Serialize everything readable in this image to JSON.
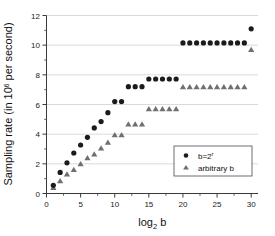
{
  "chart_data": {
    "type": "scatter",
    "title": "",
    "xlabel": "log2 b",
    "xlabel_base": "log",
    "xlabel_subscript": "2",
    "xlabel_arg": "b",
    "ylabel": "Sampling rate (in 10^6 per second)",
    "ylabel_prefix": "Sampling rate (in 10",
    "ylabel_exponent": "6",
    "ylabel_suffix": " per second)",
    "xlim": [
      0,
      31
    ],
    "ylim": [
      0,
      12
    ],
    "xticks": [
      0,
      5,
      10,
      15,
      20,
      25,
      30
    ],
    "xticklabels": [
      "0",
      "5",
      "10",
      "15",
      "20",
      "25",
      "30"
    ],
    "yticks": [
      0,
      2,
      4,
      6,
      8,
      10,
      12
    ],
    "yticklabels": [
      "0",
      "2",
      "4",
      "6",
      "8",
      "10",
      "12"
    ],
    "grid": "horizontal",
    "legend_position": "lower-right",
    "series": [
      {
        "name": "b=2^r",
        "label_base": "b=2",
        "label_sup": "r",
        "marker": "circle",
        "color": "#1b1b1b",
        "x": [
          1,
          2,
          3,
          4,
          5,
          6,
          7,
          8,
          9,
          10,
          11,
          12,
          13,
          14,
          15,
          16,
          17,
          18,
          19,
          20,
          21,
          22,
          23,
          24,
          25,
          26,
          27,
          28,
          29,
          30
        ],
        "y": [
          0.55,
          1.42,
          2.07,
          2.73,
          3.27,
          3.79,
          4.42,
          4.85,
          5.45,
          6.2,
          6.2,
          7.2,
          7.2,
          7.2,
          7.72,
          7.72,
          7.72,
          7.72,
          7.72,
          10.15,
          10.15,
          10.15,
          10.15,
          10.15,
          10.15,
          10.15,
          10.15,
          10.15,
          10.15,
          11.1
        ]
      },
      {
        "name": "arbitrary b",
        "label_base": "arbitrary b",
        "label_sup": "",
        "marker": "triangle",
        "color": "#6f6f6f",
        "x": [
          1,
          2,
          3,
          4,
          5,
          6,
          7,
          8,
          9,
          10,
          11,
          12,
          13,
          14,
          15,
          16,
          17,
          18,
          19,
          20,
          21,
          22,
          23,
          24,
          25,
          26,
          27,
          28,
          29,
          30
        ],
        "y": [
          0.4,
          0.85,
          1.3,
          1.6,
          2.0,
          2.4,
          2.65,
          3.05,
          3.45,
          3.95,
          3.95,
          4.67,
          4.67,
          4.67,
          5.7,
          5.7,
          5.7,
          5.7,
          5.7,
          7.18,
          7.18,
          7.18,
          7.18,
          7.18,
          7.18,
          7.18,
          7.18,
          7.18,
          7.18,
          9.7
        ]
      }
    ]
  },
  "legend": {
    "entries": [
      {
        "label_base": "b=2",
        "label_sup": "r",
        "marker": "circle"
      },
      {
        "label_base": "arbitrary b",
        "label_sup": "",
        "marker": "triangle"
      }
    ]
  },
  "colors": {
    "series_circle": "#1b1b1b",
    "series_triangle": "#6f6f6f",
    "axis": "#3a3a3a",
    "grid": "#d0d0d0",
    "background": "#ffffff"
  }
}
